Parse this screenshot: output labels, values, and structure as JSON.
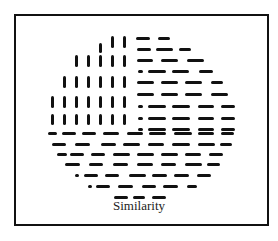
{
  "figure": {
    "caption": "Similarity",
    "vertical_rows": [
      {
        "y": 36,
        "h": 12,
        "xs": [
          123,
          111
        ]
      },
      {
        "y": 43,
        "h": 10,
        "xs": [
          99
        ]
      },
      {
        "y": 55,
        "h": 12,
        "xs": [
          75,
          87,
          99,
          111,
          123
        ]
      },
      {
        "y": 76,
        "h": 12,
        "xs": [
          63,
          75,
          87,
          99,
          111,
          123
        ]
      },
      {
        "y": 96,
        "h": 12,
        "xs": [
          51,
          63,
          75,
          87,
          99,
          111,
          123
        ]
      },
      {
        "y": 114,
        "h": 11,
        "xs": [
          51,
          63,
          75,
          87,
          99,
          111,
          123
        ]
      }
    ],
    "horizontal_rows": [
      {
        "y": 37,
        "segs": [
          [
            136,
            14
          ],
          [
            158,
            12
          ]
        ]
      },
      {
        "y": 48,
        "segs": [
          [
            137,
            14
          ],
          [
            156,
            17
          ],
          [
            179,
            12
          ]
        ]
      },
      {
        "y": 59,
        "segs": [
          [
            137,
            16
          ],
          [
            161,
            17
          ],
          [
            187,
            17
          ]
        ]
      },
      {
        "y": 70,
        "segs": [
          [
            138,
            5
          ],
          [
            148,
            18
          ],
          [
            172,
            17
          ],
          [
            199,
            14
          ]
        ]
      },
      {
        "y": 81,
        "segs": [
          [
            137,
            17
          ],
          [
            161,
            17
          ],
          [
            185,
            17
          ],
          [
            211,
            12
          ]
        ]
      },
      {
        "y": 93,
        "segs": [
          [
            137,
            17
          ],
          [
            161,
            17
          ],
          [
            185,
            17
          ],
          [
            211,
            17
          ]
        ]
      },
      {
        "y": 105,
        "segs": [
          [
            138,
            5
          ],
          [
            148,
            18
          ],
          [
            172,
            18
          ],
          [
            198,
            16
          ],
          [
            221,
            14
          ]
        ]
      },
      {
        "y": 117,
        "segs": [
          [
            138,
            5
          ],
          [
            148,
            18
          ],
          [
            172,
            18
          ],
          [
            198,
            16
          ],
          [
            221,
            14
          ]
        ]
      },
      {
        "y": 128,
        "segs": [
          [
            138,
            5
          ],
          [
            148,
            18
          ],
          [
            172,
            18
          ],
          [
            198,
            16
          ],
          [
            221,
            14
          ]
        ]
      },
      {
        "y": 132,
        "segs": [
          [
            48,
            9
          ],
          [
            62,
            14
          ],
          [
            82,
            14
          ],
          [
            103,
            16
          ],
          [
            127,
            16
          ],
          [
            149,
            17
          ],
          [
            174,
            18
          ],
          [
            198,
            16
          ],
          [
            221,
            13
          ]
        ]
      },
      {
        "y": 143,
        "segs": [
          [
            52,
            14
          ],
          [
            75,
            15
          ],
          [
            101,
            15
          ],
          [
            123,
            17
          ],
          [
            148,
            16
          ],
          [
            172,
            18
          ],
          [
            198,
            17
          ],
          [
            220,
            12
          ]
        ]
      },
      {
        "y": 153,
        "segs": [
          [
            57,
            10
          ],
          [
            70,
            14
          ],
          [
            91,
            14
          ],
          [
            113,
            17
          ],
          [
            137,
            17
          ],
          [
            161,
            17
          ],
          [
            185,
            16
          ],
          [
            209,
            14
          ]
        ]
      },
      {
        "y": 163,
        "segs": [
          [
            65,
            15
          ],
          [
            89,
            14
          ],
          [
            113,
            15
          ],
          [
            137,
            16
          ],
          [
            161,
            15
          ],
          [
            185,
            17
          ],
          [
            207,
            13
          ]
        ]
      },
      {
        "y": 174,
        "segs": [
          [
            75,
            4
          ],
          [
            84,
            14
          ],
          [
            105,
            14
          ],
          [
            129,
            17
          ],
          [
            152,
            15
          ],
          [
            174,
            15
          ],
          [
            197,
            14
          ]
        ]
      },
      {
        "y": 185,
        "segs": [
          [
            88,
            4
          ],
          [
            96,
            14
          ],
          [
            118,
            15
          ],
          [
            142,
            14
          ],
          [
            163,
            15
          ],
          [
            187,
            10
          ]
        ]
      },
      {
        "y": 196,
        "segs": [
          [
            114,
            14
          ],
          [
            133,
            12
          ],
          [
            152,
            14
          ]
        ]
      }
    ]
  }
}
